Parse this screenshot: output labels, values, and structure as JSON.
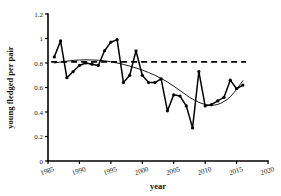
{
  "chart_data": {
    "type": "line",
    "title": "",
    "xlabel": "year",
    "ylabel": "young fledged per pair",
    "xlim": [
      1985,
      2020
    ],
    "ylim": [
      0,
      1.2
    ],
    "grid": false,
    "legend": "none",
    "x_ticks": [
      "1985",
      "1990",
      "1995",
      "2000",
      "2005",
      "2010",
      "2015",
      "2020"
    ],
    "x_tick_values": [
      1985,
      1990,
      1995,
      2000,
      2005,
      2010,
      2015,
      2020
    ],
    "y_ticks": [
      "0",
      "0.2",
      "0.4",
      "0.6",
      "0.8",
      "1",
      "1.2"
    ],
    "y_tick_values": [
      0,
      0.2,
      0.4,
      0.6,
      0.8,
      1.0,
      1.2
    ],
    "x": [
      1986,
      1987,
      1988,
      1989,
      1990,
      1991,
      1992,
      1993,
      1994,
      1995,
      1996,
      1997,
      1998,
      1999,
      2000,
      2001,
      2002,
      2003,
      2004,
      2005,
      2006,
      2007,
      2008,
      2009,
      2010,
      2011,
      2012,
      2013,
      2014,
      2015,
      2016
    ],
    "series": [
      {
        "name": "young fledged per pair",
        "marker": "filled-circle",
        "values": [
          0.85,
          0.98,
          0.68,
          0.73,
          0.78,
          0.8,
          0.79,
          0.78,
          0.9,
          0.97,
          0.99,
          0.64,
          0.7,
          0.9,
          0.7,
          0.64,
          0.64,
          0.67,
          0.41,
          0.54,
          0.53,
          0.45,
          0.27,
          0.73,
          0.45,
          0.46,
          0.49,
          0.52,
          0.66,
          0.59,
          0.62
        ]
      }
    ],
    "trend": {
      "name": "polynomial trend",
      "style": "solid-thin",
      "x": [
        1986,
        1988,
        1990,
        1992,
        1994,
        1996,
        1998,
        2000,
        2002,
        2004,
        2006,
        2008,
        2010,
        2012,
        2014,
        2016
      ],
      "values": [
        0.8,
        0.815,
        0.825,
        0.825,
        0.818,
        0.8,
        0.775,
        0.742,
        0.7,
        0.645,
        0.575,
        0.505,
        0.462,
        0.462,
        0.525,
        0.655
      ]
    },
    "reference_line": {
      "name": "baseline reference",
      "style": "dashed",
      "y": 0.81,
      "x_start": 1985.5,
      "x_end": 2016.5
    }
  },
  "axes": {
    "x_title": "year",
    "y_title": "young fledged per pair"
  }
}
